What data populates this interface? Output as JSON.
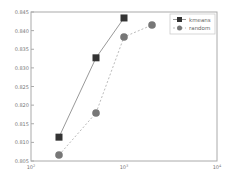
{
  "chart_data": {
    "type": "line",
    "title": "",
    "xlabel": "",
    "ylabel": "",
    "xscale": "log",
    "xlim": [
      100,
      10000
    ],
    "ylim": [
      0.805,
      0.845
    ],
    "grid": false,
    "legend_position": "upper right",
    "x_ticks": [
      "10^2",
      "10^3",
      "10^4"
    ],
    "y_ticks": [
      "0.805",
      "0.810",
      "0.815",
      "0.820",
      "0.825",
      "0.830",
      "0.835",
      "0.840",
      "0.845"
    ],
    "series": [
      {
        "name": "kmeans",
        "marker": "square",
        "line": "solid",
        "color": "#333333",
        "x": [
          200,
          500,
          1000
        ],
        "values": [
          0.8114,
          0.8327,
          0.8434
        ]
      },
      {
        "name": "random",
        "marker": "circle",
        "line": "dashed",
        "color": "#777777",
        "x": [
          200,
          500,
          1000,
          2000
        ],
        "values": [
          0.8066,
          0.8179,
          0.8383,
          0.8415
        ]
      }
    ]
  }
}
